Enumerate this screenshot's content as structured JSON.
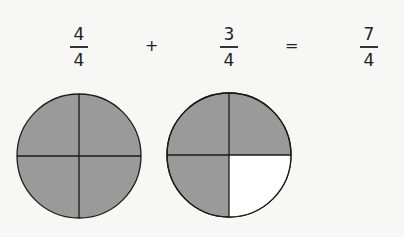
{
  "equation": {
    "terms": [
      {
        "numerator": "4",
        "denominator": "4"
      },
      {
        "numerator": "3",
        "denominator": "4"
      },
      {
        "numerator": "7",
        "denominator": "4"
      }
    ],
    "plus": "+",
    "equals": "="
  },
  "circles": [
    {
      "label": "four-fourths",
      "parts": 4,
      "shaded": [
        true,
        true,
        true,
        true
      ]
    },
    {
      "label": "three-fourths",
      "parts": 4,
      "shaded": [
        true,
        true,
        true,
        false
      ]
    }
  ],
  "colors": {
    "shade": "#9a9a9a",
    "unshaded": "#ffffff",
    "stroke": "#1a1a1a"
  }
}
